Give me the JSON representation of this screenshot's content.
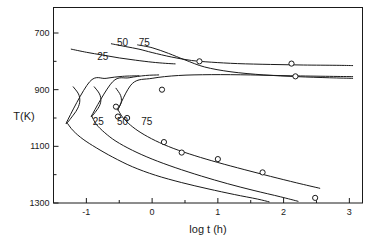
{
  "figure": {
    "background_color": "#ffffff",
    "line_color": "#1a1a1a"
  },
  "axes": {
    "x_title": "log t (h)",
    "y_title": "T(K)",
    "x_tick_labels": [
      "-1",
      "0",
      "1",
      "2",
      "3"
    ],
    "y_tick_labels": [
      "1300",
      "1100",
      "900",
      "700"
    ]
  },
  "labels": {
    "upper_25": "25",
    "upper_50": "50",
    "upper_75": "75",
    "lower_25": "25",
    "lower_50": "50",
    "lower_75": "75"
  },
  "chart_data": {
    "type": "line",
    "title": "",
    "xlabel": "log t (h)",
    "ylabel": "T(K)",
    "xlim": [
      -1.5,
      3.2
    ],
    "ylim": [
      700,
      1390
    ],
    "x_ticks": [
      -1,
      0,
      1,
      2,
      3
    ],
    "y_ticks": [
      700,
      900,
      1100,
      1300
    ],
    "x_minor_ticks": [
      -0.5,
      0.5,
      1.5,
      2.5
    ],
    "y_minor_ticks": [
      800,
      1000,
      1200
    ],
    "grid": false,
    "legend": "none",
    "annotations": [
      {
        "text": "25",
        "x": -0.75,
        "y": 1205,
        "series": "upper-25"
      },
      {
        "text": "50",
        "x": -0.45,
        "y": 1255,
        "series": "upper-50"
      },
      {
        "text": "75",
        "x": -0.12,
        "y": 1255,
        "series": "upper-75"
      },
      {
        "text": "25",
        "x": -0.82,
        "y": 975,
        "series": "lower-25"
      },
      {
        "text": "50",
        "x": -0.45,
        "y": 975,
        "series": "lower-50"
      },
      {
        "text": "75",
        "x": -0.08,
        "y": 975,
        "series": "lower-75"
      }
    ],
    "series": [
      {
        "name": "upper-25",
        "label": "25",
        "comment": "upper transformation boundary, 25 pct",
        "points": [
          [
            -1.23,
            1243
          ],
          [
            -1.0,
            1232
          ],
          [
            -0.75,
            1222
          ],
          [
            -0.5,
            1212
          ],
          [
            -0.25,
            1204
          ],
          [
            0.0,
            1197
          ],
          [
            0.2,
            1193
          ],
          [
            0.35,
            1191
          ]
        ]
      },
      {
        "name": "upper-50",
        "label": "50",
        "comment": "upper transformation boundary, 50 pct",
        "points": [
          [
            -0.62,
            1262
          ],
          [
            -0.4,
            1252
          ],
          [
            -0.2,
            1243
          ],
          [
            0.0,
            1231
          ],
          [
            0.3,
            1215
          ],
          [
            0.6,
            1203
          ],
          [
            0.9,
            1197
          ],
          [
            1.3,
            1192
          ],
          [
            1.8,
            1189
          ],
          [
            2.3,
            1187
          ],
          [
            2.8,
            1186
          ],
          [
            3.05,
            1185
          ]
        ]
      },
      {
        "name": "upper-75",
        "label": "75",
        "comment": "upper transformation boundary, 75 pct",
        "points": [
          [
            -0.22,
            1258
          ],
          [
            0.0,
            1248
          ],
          [
            0.25,
            1228
          ],
          [
            0.5,
            1205
          ],
          [
            0.8,
            1180
          ],
          [
            1.2,
            1163
          ],
          [
            1.7,
            1152
          ],
          [
            2.2,
            1146
          ],
          [
            2.7,
            1142
          ],
          [
            3.05,
            1140
          ]
        ]
      },
      {
        "name": "lower-25",
        "label": "25",
        "comment": "C-curve nose, 25 pct",
        "points": [
          [
            -1.2,
            1110
          ],
          [
            -1.12,
            1085
          ],
          [
            -1.1,
            1060
          ],
          [
            -1.13,
            1035
          ],
          [
            -1.2,
            1010
          ],
          [
            -1.3,
            985
          ],
          [
            -0.95,
            1128
          ],
          [
            -0.7,
            1140
          ],
          [
            -0.45,
            1147
          ],
          [
            -0.2,
            1149
          ]
        ]
      },
      {
        "name": "lower-50",
        "label": "50",
        "comment": "C-curve nose, 50 pct",
        "points": [
          [
            -0.88,
            1110
          ],
          [
            -0.8,
            1085
          ],
          [
            -0.78,
            1060
          ],
          [
            -0.82,
            1035
          ],
          [
            -0.92,
            1008
          ],
          [
            -0.6,
            1128
          ],
          [
            -0.35,
            1142
          ],
          [
            -0.1,
            1150
          ],
          [
            0.1,
            1152
          ]
        ]
      },
      {
        "name": "lower-75",
        "label": "75",
        "comment": "C-curve nose, 75 pct",
        "points": [
          [
            -0.55,
            1105
          ],
          [
            -0.48,
            1080
          ],
          [
            -0.47,
            1055
          ],
          [
            -0.52,
            1030
          ],
          [
            -0.3,
            1122
          ],
          [
            0.0,
            1140
          ],
          [
            0.4,
            1150
          ],
          [
            0.9,
            1153
          ],
          [
            1.5,
            1152
          ],
          [
            2.1,
            1149
          ],
          [
            2.7,
            1147
          ],
          [
            3.05,
            1146
          ]
        ]
      },
      {
        "name": "lower-25-tail",
        "label": "25",
        "comment": "lower branch descending, 25 pct",
        "points": [
          [
            -1.3,
            985
          ],
          [
            -1.2,
            955
          ],
          [
            -1.05,
            925
          ],
          [
            -0.85,
            895
          ],
          [
            -0.6,
            862
          ],
          [
            -0.3,
            828
          ],
          [
            0.05,
            798
          ],
          [
            0.45,
            772
          ],
          [
            0.85,
            750
          ],
          [
            1.25,
            730
          ],
          [
            1.6,
            714
          ],
          [
            1.78,
            704
          ]
        ]
      },
      {
        "name": "lower-50-tail",
        "label": "50",
        "comment": "lower branch descending, 50 pct",
        "points": [
          [
            -0.92,
            1008
          ],
          [
            -0.85,
            978
          ],
          [
            -0.72,
            948
          ],
          [
            -0.55,
            918
          ],
          [
            -0.3,
            886
          ],
          [
            0.0,
            855
          ],
          [
            0.35,
            825
          ],
          [
            0.75,
            795
          ],
          [
            1.15,
            768
          ],
          [
            1.55,
            744
          ],
          [
            1.95,
            722
          ],
          [
            2.22,
            706
          ]
        ]
      },
      {
        "name": "lower-75-tail",
        "label": "75",
        "comment": "lower branch descending, 75 pct",
        "points": [
          [
            -0.52,
            1030
          ],
          [
            -0.45,
            1003
          ],
          [
            -0.33,
            975
          ],
          [
            -0.17,
            948
          ],
          [
            0.05,
            920
          ],
          [
            0.32,
            893
          ],
          [
            0.65,
            867
          ],
          [
            1.0,
            843
          ],
          [
            1.4,
            818
          ],
          [
            1.8,
            794
          ],
          [
            2.2,
            771
          ],
          [
            2.55,
            752
          ]
        ]
      }
    ],
    "data_points": [
      {
        "x": 0.72,
        "y": 1200,
        "series": "upper-50"
      },
      {
        "x": 2.12,
        "y": 1192,
        "series": "upper-50"
      },
      {
        "x": 2.18,
        "y": 1147,
        "series": "upper-75"
      },
      {
        "x": 0.15,
        "y": 1100,
        "series": "lower-75"
      },
      {
        "x": -0.55,
        "y": 1040,
        "series": "lower-75"
      },
      {
        "x": -0.52,
        "y": 1005,
        "series": "lower-50"
      },
      {
        "x": -0.38,
        "y": 1000,
        "series": "lower-75"
      },
      {
        "x": 0.18,
        "y": 915,
        "series": "lower-75-tail"
      },
      {
        "x": 0.45,
        "y": 878,
        "series": "lower-75-tail"
      },
      {
        "x": 1.0,
        "y": 855,
        "series": "lower-75-tail"
      },
      {
        "x": 1.68,
        "y": 808,
        "series": "lower-75-tail"
      },
      {
        "x": 2.48,
        "y": 718,
        "series": "lower-75-tail"
      }
    ]
  }
}
